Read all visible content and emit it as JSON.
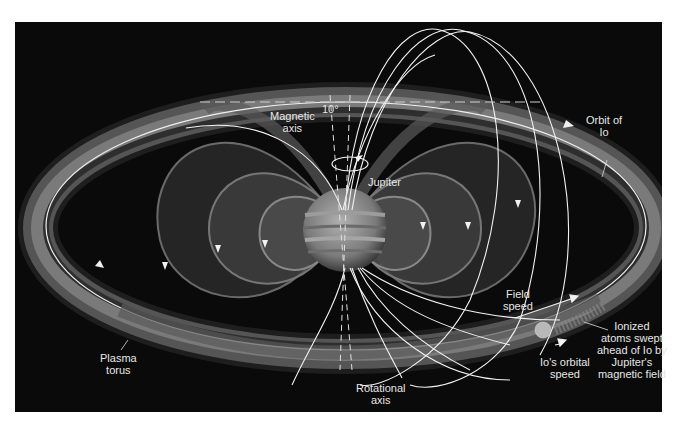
{
  "diagram": {
    "labels": {
      "magnetic_axis": [
        "Magnetic",
        "axis"
      ],
      "tilt_angle": "10°",
      "jupiter": "Jupiter",
      "orbit_of_io": [
        "Orbit of",
        "Io"
      ],
      "field_speed": [
        "Field",
        "speed"
      ],
      "ionized_atoms": [
        "Ionized",
        "atoms swept",
        "ahead of Io by",
        "Jupiter's",
        "magnetic field"
      ],
      "io_orbital_speed": [
        "Io's orbital",
        "speed"
      ],
      "plasma_torus": [
        "Plasma",
        "torus"
      ],
      "rotational_axis": [
        "Rotational",
        "axis"
      ]
    },
    "colors": {
      "background": "#0a0a0a",
      "frame": "#ffffff",
      "torus": "#6e6e6e",
      "field_lines": "#f2f2f2",
      "text": "#e6e6e6",
      "jupiter": "#8a8a8a"
    }
  }
}
